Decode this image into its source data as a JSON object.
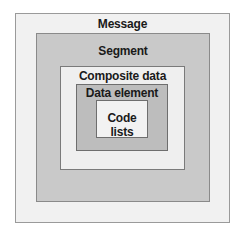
{
  "diagram": {
    "levels": [
      {
        "label": "Message",
        "fill": "#f1f1f1"
      },
      {
        "label": "Segment",
        "fill": "#c9c9c9"
      },
      {
        "label": "Composite data element",
        "fill": "#efefef"
      },
      {
        "label": "Data element",
        "fill": "#bdbdbd"
      },
      {
        "label": "Code lists",
        "fill": "#f2f2f2"
      }
    ]
  }
}
